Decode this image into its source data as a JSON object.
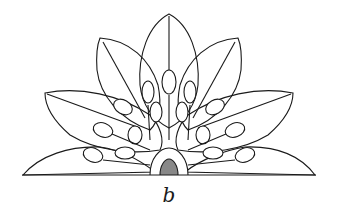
{
  "figure": {
    "label": "b",
    "colors": {
      "ink": "#1a1a1a",
      "background": "#ffffff"
    }
  }
}
